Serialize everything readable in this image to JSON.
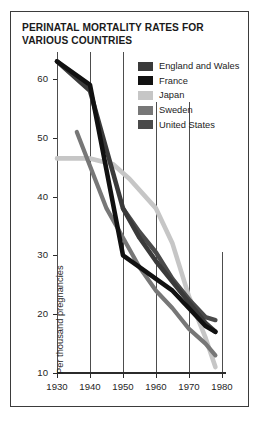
{
  "chart_data": {
    "type": "line",
    "title": "PERINATAL MORTALITY RATES FOR VARIOUS COUNTRIES",
    "xlabel": "",
    "ylabel": "Per thousand pregnancies",
    "xlim": [
      1930,
      1980
    ],
    "ylim": [
      8,
      66
    ],
    "xticks": [
      1930,
      1940,
      1950,
      1960,
      1970,
      1980
    ],
    "yticks": [
      10,
      20,
      30,
      40,
      50,
      60
    ],
    "grid": "vertical",
    "legend_position": "top-right",
    "series": [
      {
        "name": "England and Wales",
        "color": "#3a3a3a",
        "x": [
          1930,
          1940,
          1950,
          1955,
          1960,
          1965,
          1970,
          1975,
          1978
        ],
        "values": [
          63,
          58,
          38,
          33,
          29,
          25.5,
          22,
          18.5,
          17
        ]
      },
      {
        "name": "France",
        "color": "#111111",
        "x": [
          1930,
          1940,
          1950,
          1960,
          1965,
          1970,
          1975,
          1978
        ],
        "values": [
          63,
          59,
          30,
          26,
          24,
          21,
          18,
          17
        ]
      },
      {
        "name": "Japan",
        "color": "#c6c6c6",
        "x": [
          1930,
          1940,
          1947,
          1952,
          1960,
          1965,
          1970,
          1975,
          1978
        ],
        "values": [
          46.5,
          46.5,
          45.5,
          43,
          38,
          32,
          23,
          16,
          11
        ]
      },
      {
        "name": "Sweden",
        "color": "#777777",
        "x": [
          1936,
          1945,
          1950,
          1955,
          1960,
          1965,
          1970,
          1975,
          1978
        ],
        "values": [
          51,
          38,
          33,
          28,
          24,
          21,
          17.5,
          15,
          13
        ]
      },
      {
        "name": "United States",
        "color": "#4a4a4a",
        "x": [
          1950,
          1955,
          1960,
          1965,
          1970,
          1975,
          1978
        ],
        "values": [
          38,
          34,
          30.5,
          26,
          22.5,
          19.5,
          19
        ]
      }
    ]
  },
  "legend": {
    "items": [
      {
        "label": "England and Wales",
        "color": "#3a3a3a"
      },
      {
        "label": "France",
        "color": "#111111"
      },
      {
        "label": "Japan",
        "color": "#c6c6c6"
      },
      {
        "label": "Sweden",
        "color": "#777777"
      },
      {
        "label": "United States",
        "color": "#4a4a4a"
      }
    ]
  },
  "axes": {
    "y_tick_labels": [
      "60",
      "50",
      "40",
      "30",
      "20",
      "10"
    ],
    "x_tick_labels": [
      "1930",
      "1940",
      "1950",
      "1960",
      "1970",
      "1980"
    ],
    "y_axis_title": "Per thousand pregnancies"
  },
  "colors": {
    "border": "#3b3b3b",
    "background": "#ffffff",
    "gridline": "#5a5a5a",
    "axis": "#3b3b3b",
    "text": "#1a1a1a"
  }
}
